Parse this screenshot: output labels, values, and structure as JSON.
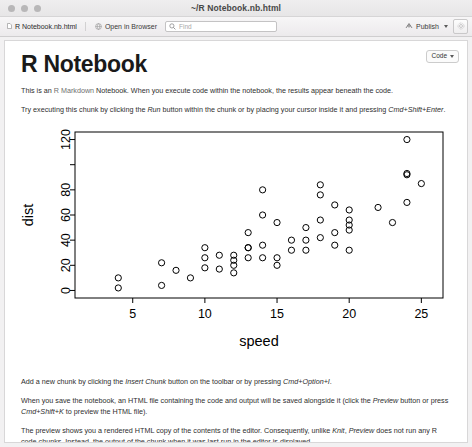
{
  "window": {
    "title": "~/R Notebook.nb.html",
    "traffic_lights": [
      "close",
      "minimize",
      "zoom"
    ]
  },
  "toolbar": {
    "document_tab": "R Notebook.nb.html",
    "open_in_browser": "Open in Browser",
    "find_placeholder": "Find",
    "find_value": "",
    "publish": "Publish",
    "settings_icon": "gear-icon"
  },
  "document": {
    "code_button": "Code",
    "title": "R Notebook",
    "paragraph_1": {
      "before_link": "This is an ",
      "link": "R Markdown",
      "after_link": " Notebook. When you execute code within the notebook, the results appear beneath the code."
    },
    "paragraph_2": {
      "p1": "Try executing this chunk by clicking the ",
      "i1": "Run",
      "p2": " button within the chunk or by placing your cursor inside it and pressing ",
      "i2": "Cmd+Shift+Enter",
      "p3": "."
    },
    "paragraph_3": {
      "p1": "Add a new chunk by clicking the ",
      "i1": "Insert Chunk",
      "p2": " button on the toolbar or by pressing ",
      "i2": "Cmd+Option+I",
      "p3": "."
    },
    "paragraph_4": {
      "p1": "When you save the notebook, an HTML file containing the code and output will be saved alongside it (click the ",
      "i1": "Preview",
      "p2": " button or press ",
      "i2": "Cmd+Shift+K",
      "p3": " to preview the HTML file)."
    },
    "paragraph_5": {
      "p1": "The preview shows you a rendered HTML copy of the contents of the editor. Consequently, unlike ",
      "i1": "Knit",
      "p2": ", ",
      "i2": "Preview",
      "p3": " does not run any R code chunks. Instead, the output of the chunk when it was last run in the editor is displayed."
    }
  },
  "chart_data": {
    "type": "scatter",
    "title": "",
    "xlabel": "speed",
    "ylabel": "dist",
    "xlim": [
      1.0,
      26.5
    ],
    "ylim": [
      -6,
      126
    ],
    "xticks": [
      5,
      10,
      15,
      20,
      25
    ],
    "yticks": [
      0,
      20,
      40,
      60,
      80,
      100,
      120
    ],
    "ytick_labels": [
      "0",
      "20",
      "40",
      "60",
      "80",
      "",
      "120"
    ],
    "grid": false,
    "legend": null,
    "point_style": "open-circle",
    "point_color": "#000000",
    "x": [
      4,
      4,
      7,
      7,
      8,
      9,
      10,
      10,
      10,
      11,
      11,
      12,
      12,
      12,
      12,
      13,
      13,
      13,
      13,
      14,
      14,
      14,
      14,
      15,
      15,
      15,
      16,
      16,
      17,
      17,
      17,
      18,
      18,
      18,
      18,
      19,
      19,
      19,
      20,
      20,
      20,
      20,
      20,
      22,
      23,
      24,
      24,
      24,
      24,
      25
    ],
    "y": [
      2,
      10,
      4,
      22,
      16,
      10,
      18,
      26,
      34,
      17,
      28,
      14,
      20,
      24,
      28,
      26,
      34,
      34,
      46,
      26,
      36,
      60,
      80,
      20,
      26,
      54,
      32,
      40,
      32,
      40,
      50,
      42,
      56,
      76,
      84,
      36,
      46,
      68,
      32,
      48,
      52,
      56,
      64,
      66,
      54,
      70,
      92,
      93,
      120,
      85
    ]
  },
  "colors": {
    "accent": "#6f6f6f",
    "text": "#2e2e2e",
    "chrome": "#efeeef",
    "plot_line": "#000000"
  }
}
